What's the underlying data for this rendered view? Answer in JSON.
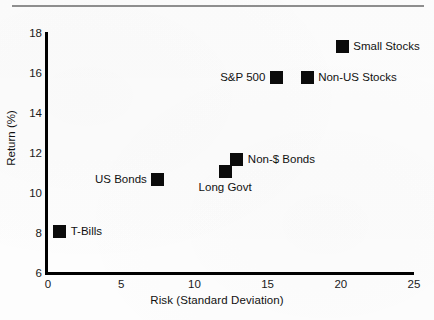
{
  "chart_data": {
    "type": "scatter",
    "title": "",
    "xlabel": "Risk (Standard  Deviation)",
    "ylabel": "Return (%)",
    "xlim": [
      0,
      25
    ],
    "ylim": [
      6,
      18
    ],
    "xticks": [
      "0",
      "5",
      "10",
      "15",
      "20",
      "25"
    ],
    "xtick_values": [
      0,
      5,
      10,
      15,
      20,
      25
    ],
    "yticks": [
      "6",
      "8",
      "10",
      "12",
      "14",
      "16",
      "18"
    ],
    "ytick_values": [
      6,
      8,
      10,
      12,
      14,
      16,
      18
    ],
    "grid": false,
    "legend": "none",
    "marker_color": "#0b0b0b",
    "axis_color": "#000000",
    "points": [
      {
        "name": "T-Bills",
        "x": 0.8,
        "y": 8.1,
        "label": "T-Bills",
        "label_pos": "right"
      },
      {
        "name": "US Bonds",
        "x": 7.5,
        "y": 10.7,
        "label": "US Bonds",
        "label_pos": "left"
      },
      {
        "name": "Long Govt",
        "x": 12.1,
        "y": 11.1,
        "label": "Long Govt",
        "label_pos": "below"
      },
      {
        "name": "Non-$ Bonds",
        "x": 12.9,
        "y": 11.7,
        "label": "Non-$ Bonds",
        "label_pos": "right"
      },
      {
        "name": "S&P 500",
        "x": 15.6,
        "y": 15.8,
        "label": "S&P 500",
        "label_pos": "left"
      },
      {
        "name": "Non-US Stocks",
        "x": 17.7,
        "y": 15.8,
        "label": "Non-US Stocks",
        "label_pos": "right"
      },
      {
        "name": "Small Stocks",
        "x": 20.1,
        "y": 17.35,
        "label": "Small Stocks",
        "label_pos": "right"
      }
    ]
  }
}
